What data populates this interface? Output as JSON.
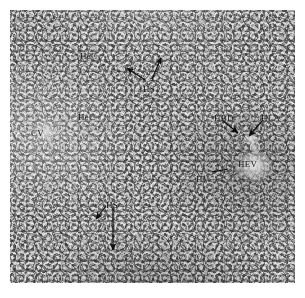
{
  "figure": {
    "type": "light-micrograph",
    "staining_tone": "grayscale",
    "plate": {
      "x": 10,
      "y": 10,
      "width": 285,
      "height": 273,
      "background_color": "#8f8f8f",
      "border_color": "#ffffff"
    }
  },
  "labels": [
    {
      "id": "hec-upper",
      "text": "HeC",
      "meaning": "hepatocytes",
      "x": 80,
      "y": 52
    },
    {
      "id": "hs-upper",
      "text": "HS",
      "meaning": "hepatic sinusoid",
      "x": 143,
      "y": 85
    },
    {
      "id": "hec-lower",
      "text": "HeC",
      "meaning": "hepatocytes",
      "x": 78,
      "y": 113
    },
    {
      "id": "cv",
      "text": "CV",
      "meaning": "central vein",
      "x": 31,
      "y": 129
    },
    {
      "id": "hbd",
      "text": "HBD",
      "meaning": "hepatic bile duct",
      "x": 214,
      "y": 114
    },
    {
      "id": "hla",
      "text": "HLA",
      "meaning": "hepatic artery",
      "x": 261,
      "y": 114
    },
    {
      "id": "hv",
      "text": "HV",
      "meaning": "hepatic venule",
      "x": 196,
      "y": 175
    },
    {
      "id": "hev",
      "text": "HEV",
      "meaning": "hepatic efferent vein",
      "x": 238,
      "y": 160
    },
    {
      "id": "hs-lower",
      "text": "HS",
      "meaning": "hepatic sinusoid",
      "x": 106,
      "y": 201
    }
  ],
  "arrows": [
    {
      "id": "hs-upper-arrow-left",
      "from_label": "HS",
      "x1": 145,
      "y1": 80,
      "x2": 127,
      "y2": 68,
      "head": "end"
    },
    {
      "id": "hs-upper-arrow-right",
      "from_label": "HS",
      "x1": 152,
      "y1": 79,
      "x2": 161,
      "y2": 58,
      "head": "end"
    },
    {
      "id": "hbd-arrow",
      "from_label": "HBD",
      "x1": 222,
      "y1": 120,
      "x2": 238,
      "y2": 133,
      "head": "end"
    },
    {
      "id": "hla-arrow",
      "from_label": "HLA",
      "x1": 263,
      "y1": 120,
      "x2": 249,
      "y2": 136,
      "head": "end"
    },
    {
      "id": "hv-pointer",
      "from_label": "HV",
      "x1": 212,
      "y1": 172,
      "x2": 228,
      "y2": 169,
      "head": "none"
    },
    {
      "id": "hs-lower-arrow-left",
      "from_label": "HS",
      "x1": 106,
      "y1": 206,
      "x2": 96,
      "y2": 219,
      "head": "end"
    },
    {
      "id": "hs-lower-arrow-down",
      "from_label": "HS",
      "x1": 113,
      "y1": 206,
      "x2": 113,
      "y2": 250,
      "head": "end"
    }
  ],
  "structures": [
    {
      "id": "central-vein-lumen",
      "label_ref": "cv",
      "shape": "ellipse",
      "cx": 35,
      "cy": 122,
      "rx": 15,
      "ry": 10
    },
    {
      "id": "hev-lumen",
      "label_ref": "hev",
      "shape": "ellipse",
      "cx": 244,
      "cy": 157,
      "rx": 19,
      "ry": 15
    },
    {
      "id": "bile-duct-lumen",
      "label_ref": "hbd",
      "shape": "ellipse",
      "cx": 241,
      "cy": 128,
      "rx": 8,
      "ry": 7
    },
    {
      "id": "artery-lumen",
      "label_ref": "hla",
      "shape": "ellipse",
      "cx": 244,
      "cy": 138,
      "rx": 5,
      "ry": 7
    }
  ],
  "colors": {
    "tissue_mid": "#8f8f8f",
    "tissue_light": "#c8c8c8",
    "tissue_dark": "#6b6b6b",
    "annotation": "#101010",
    "page_background": "#ffffff"
  }
}
